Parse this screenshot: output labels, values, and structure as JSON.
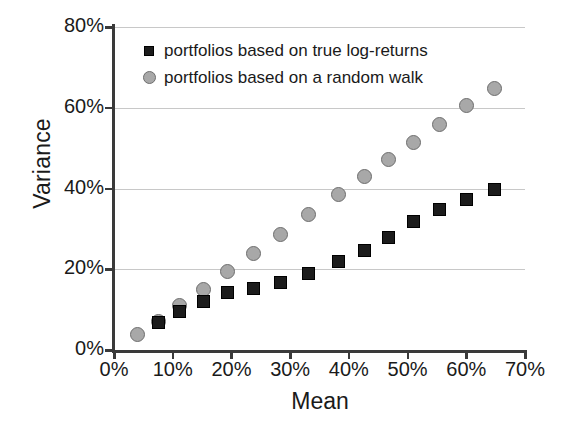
{
  "chart_data": {
    "type": "scatter",
    "title": "",
    "xlabel": "Mean",
    "ylabel": "Variance",
    "xlim": [
      0,
      70
    ],
    "ylim": [
      0,
      80
    ],
    "xticks": [
      "0%",
      "10%",
      "20%",
      "30%",
      "40%",
      "50%",
      "60%",
      "70%"
    ],
    "xtick_values": [
      0,
      10,
      20,
      30,
      40,
      50,
      60,
      70
    ],
    "yticks": [
      "0%",
      "20%",
      "40%",
      "60%",
      "80%"
    ],
    "ytick_values": [
      0,
      20,
      40,
      60,
      80
    ],
    "grid": "horizontal",
    "legend_position": "top-left-inside",
    "series": [
      {
        "name": "portfolios based on true log-returns",
        "marker": "square",
        "color": "#1c1c1c",
        "points": [
          [
            7.5,
            6.8
          ],
          [
            11.2,
            9.5
          ],
          [
            15.3,
            12.0
          ],
          [
            19.4,
            14.3
          ],
          [
            23.7,
            15.3
          ],
          [
            28.3,
            16.6
          ],
          [
            33.2,
            19.0
          ],
          [
            38.3,
            21.8
          ],
          [
            42.7,
            24.6
          ],
          [
            46.8,
            27.8
          ],
          [
            51.0,
            31.8
          ],
          [
            55.5,
            34.8
          ],
          [
            60.0,
            37.3
          ],
          [
            64.8,
            39.8
          ]
        ]
      },
      {
        "name": "portfolios based on a random walk",
        "marker": "circle",
        "color": "#a8a8a8",
        "points": [
          [
            4.0,
            3.8
          ],
          [
            7.5,
            7.0
          ],
          [
            11.2,
            11.0
          ],
          [
            15.3,
            15.0
          ],
          [
            19.4,
            19.5
          ],
          [
            23.7,
            23.8
          ],
          [
            28.3,
            28.5
          ],
          [
            33.2,
            33.5
          ],
          [
            38.3,
            38.6
          ],
          [
            42.7,
            43.0
          ],
          [
            46.8,
            47.3
          ],
          [
            51.0,
            51.5
          ],
          [
            55.5,
            55.8
          ],
          [
            60.0,
            60.5
          ],
          [
            64.8,
            64.8
          ]
        ]
      }
    ]
  },
  "legend": {
    "items": [
      {
        "label": "portfolios based on true log-returns",
        "marker": "square"
      },
      {
        "label": "portfolios based on a random walk",
        "marker": "circle"
      }
    ]
  },
  "colors": {
    "axis": "#3a3a3a",
    "grid": "#c8c8c8",
    "series_square": "#1c1c1c",
    "series_circle": "#a8a8a8",
    "background": "#ffffff",
    "text": "#1a1a1a"
  }
}
